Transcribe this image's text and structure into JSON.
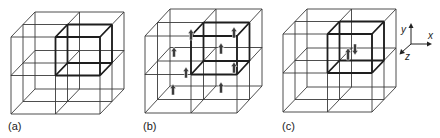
{
  "figure": {
    "panels": [
      {
        "id": "a",
        "label": "(a)",
        "description": "2x2x2 grid of cubic cells with one highlighted unit cell",
        "highlighted_cell": "front-top-right",
        "spins": []
      },
      {
        "id": "b",
        "label": "(b)",
        "description": "Grid with highlighted cell and aligned spins (all pointing up)",
        "highlighted_cell": "front-top-right",
        "spins": [
          {
            "direction": "up"
          },
          {
            "direction": "up"
          },
          {
            "direction": "up"
          },
          {
            "direction": "up"
          },
          {
            "direction": "up"
          },
          {
            "direction": "up"
          },
          {
            "direction": "up"
          },
          {
            "direction": "up"
          }
        ]
      },
      {
        "id": "c",
        "label": "(c)",
        "description": "Grid with highlighted cell containing an antiparallel spin pair",
        "highlighted_cell": "front-top-right",
        "spins": [
          {
            "direction": "up"
          },
          {
            "direction": "down"
          }
        ]
      }
    ],
    "axes": {
      "x_label": "x",
      "y_label": "y",
      "z_label": "z"
    }
  }
}
